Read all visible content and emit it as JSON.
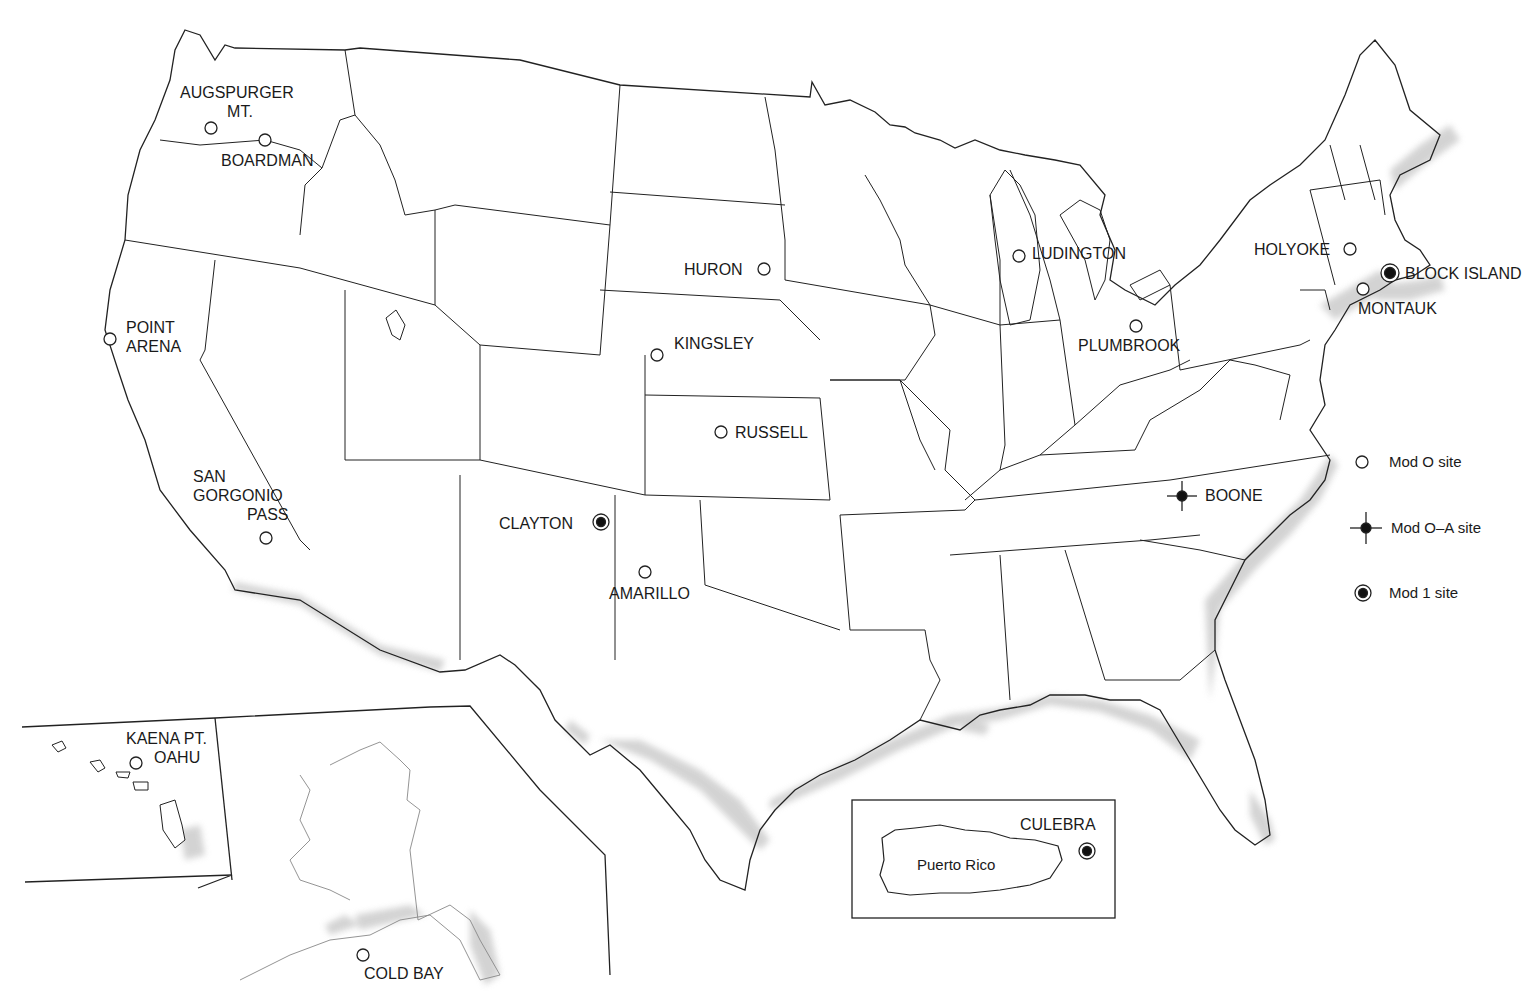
{
  "map": {
    "title": "",
    "regions": [
      "Conterminous United States",
      "Hawaii inset",
      "Alaska inset",
      "Puerto Rico inset"
    ],
    "inset_labels": {
      "puerto_rico": "Puerto Rico"
    }
  },
  "legend": {
    "items": [
      {
        "symbol": "open-circle",
        "label": "Mod O site"
      },
      {
        "symbol": "filled-dot-cross",
        "label": "Mod O–A site"
      },
      {
        "symbol": "bullseye",
        "label": "Mod 1 site"
      }
    ]
  },
  "sites": [
    {
      "id": "augspurger",
      "line1": "AUGSPURGER",
      "line2": "MT.",
      "type": "Mod O"
    },
    {
      "id": "boardman",
      "line1": "BOARDMAN",
      "type": "Mod O"
    },
    {
      "id": "point-arena",
      "line1": "POINT",
      "line2": "ARENA",
      "type": "Mod O"
    },
    {
      "id": "san-gorgonio",
      "line1": "SAN",
      "line2": "GORGONIO",
      "line3": "PASS",
      "type": "Mod O"
    },
    {
      "id": "huron",
      "line1": "HURON",
      "type": "Mod O"
    },
    {
      "id": "kingsley",
      "line1": "KINGSLEY",
      "type": "Mod O"
    },
    {
      "id": "russell",
      "line1": "RUSSELL",
      "type": "Mod O"
    },
    {
      "id": "clayton",
      "line1": "CLAYTON",
      "type": "Mod 1"
    },
    {
      "id": "amarillo",
      "line1": "AMARILLO",
      "type": "Mod O"
    },
    {
      "id": "ludington",
      "line1": "LUDINGTON",
      "type": "Mod O"
    },
    {
      "id": "plumbrook",
      "line1": "PLUMBROOK",
      "type": "Mod O"
    },
    {
      "id": "holyoke",
      "line1": "HOLYOKE",
      "type": "Mod O"
    },
    {
      "id": "block-island",
      "line1": "BLOCK ISLAND",
      "type": "Mod 1"
    },
    {
      "id": "montauk",
      "line1": "MONTAUK",
      "type": "Mod O"
    },
    {
      "id": "boone",
      "line1": "BOONE",
      "type": "Mod O-A"
    },
    {
      "id": "kaena-pt",
      "line1": "KAENA PT.",
      "line2": "OAHU",
      "type": "Mod O"
    },
    {
      "id": "cold-bay",
      "line1": "COLD BAY",
      "type": "Mod O"
    },
    {
      "id": "culebra",
      "line1": "CULEBRA",
      "type": "Mod 1"
    }
  ]
}
